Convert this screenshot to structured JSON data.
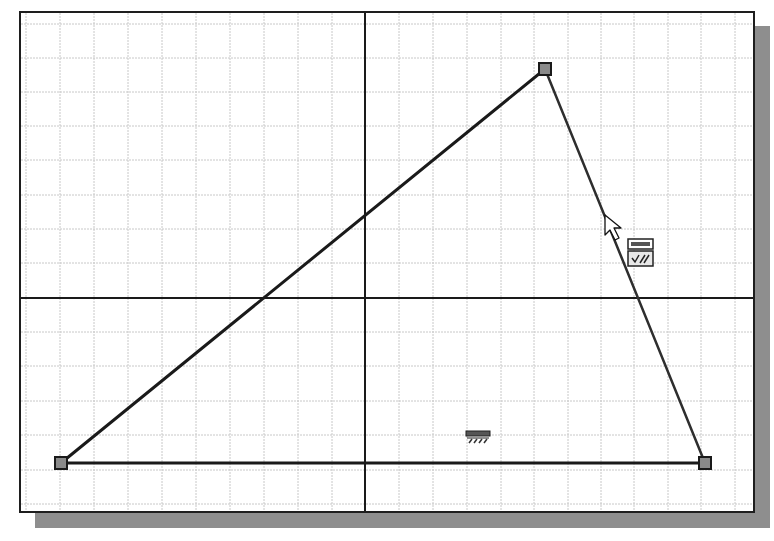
{
  "window": {
    "type": "2D sketch canvas",
    "frame": {
      "x": 19,
      "y": 11,
      "width": 736,
      "height": 502
    },
    "shadow_color": "#8e8e8e",
    "border_color": "#1e1e1e"
  },
  "grid": {
    "spacing_px": 34,
    "color": "#c8c8c8",
    "visible": true
  },
  "axes": {
    "origin": {
      "x": 363,
      "y": 296
    },
    "color": "#1a1a1a"
  },
  "sketch": {
    "entities": [
      {
        "type": "line",
        "name": "hypotenuse-left",
        "from": "p1",
        "to": "p2"
      },
      {
        "type": "line",
        "name": "edge-right",
        "from": "p2",
        "to": "p3"
      },
      {
        "type": "line",
        "name": "edge-bottom",
        "from": "p3",
        "to": "p1"
      }
    ],
    "points": {
      "p1": {
        "x": 59,
        "y": 461
      },
      "p2": {
        "x": 543,
        "y": 67
      },
      "p3": {
        "x": 703,
        "y": 461
      }
    },
    "line_color": "#1a1a1a",
    "point_fill": "#8a8a8a"
  },
  "constraints": [
    {
      "type": "horizontal",
      "icon": "horizontal-constraint-icon",
      "x": 476,
      "y": 435
    },
    {
      "type": "coincident-perpendicular",
      "icon": "constraint-glyph-stack-icon",
      "x": 638,
      "y": 250
    }
  ],
  "cursor": {
    "icon": "arrow-cursor-icon",
    "x": 603,
    "y": 213
  }
}
